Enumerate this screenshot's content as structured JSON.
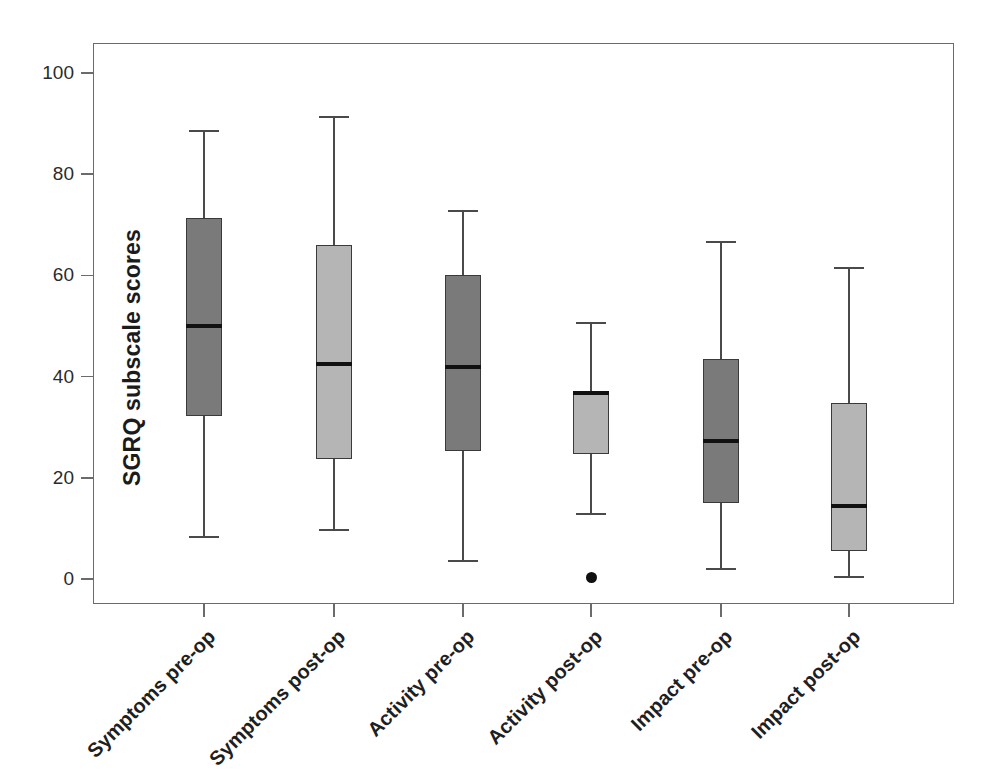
{
  "figure": {
    "width": 990,
    "height": 771,
    "background": "#ffffff",
    "frame_color": "#6b6b6b"
  },
  "chart_data": {
    "type": "box",
    "title": "",
    "xlabel": "",
    "ylabel": "SGRQ subscale scores",
    "ylim": [
      0,
      100
    ],
    "yticks": [
      0,
      20,
      40,
      60,
      80,
      100
    ],
    "ytick_labels": [
      "0",
      "20",
      "40",
      "60",
      "80",
      "100"
    ],
    "grid": false,
    "legend": "none",
    "categories": [
      "Symptoms pre-op",
      "Symptoms post-op",
      "Activity pre-op",
      "Activity post-op",
      "Impact pre-op",
      "Impact post-op"
    ],
    "colors": {
      "pre_op_fill": "#7a7a7a",
      "post_op_fill": "#b5b5b5",
      "median_line": "#111111",
      "box_edge": "#3a3a3a",
      "whisker": "#4a4a4a",
      "outlier": "#101010"
    },
    "boxes": [
      {
        "category": "Symptoms pre-op",
        "fill": "dark",
        "whisker_high": 88.7,
        "q3": 71.3,
        "median": 50.0,
        "q1": 32.2,
        "whisker_low": 8.5,
        "outliers": []
      },
      {
        "category": "Symptoms post-op",
        "fill": "light",
        "whisker_high": 91.5,
        "q3": 66.0,
        "median": 42.5,
        "q1": 23.7,
        "whisker_low": 9.9,
        "outliers": []
      },
      {
        "category": "Activity pre-op",
        "fill": "dark",
        "whisker_high": 72.9,
        "q3": 60.1,
        "median": 41.9,
        "q1": 25.3,
        "whisker_low": 3.8,
        "outliers": []
      },
      {
        "category": "Activity post-op",
        "fill": "light",
        "whisker_high": 50.8,
        "q3": 37.2,
        "median": 36.8,
        "q1": 24.7,
        "whisker_low": 13.0,
        "outliers": [
          0.2
        ]
      },
      {
        "category": "Impact pre-op",
        "fill": "dark",
        "whisker_high": 66.8,
        "q3": 43.5,
        "median": 27.3,
        "q1": 15.0,
        "whisker_low": 2.2,
        "outliers": []
      },
      {
        "category": "Impact post-op",
        "fill": "light",
        "whisker_high": 61.7,
        "q3": 34.8,
        "median": 14.4,
        "q1": 5.5,
        "whisker_low": 0.6,
        "outliers": []
      }
    ]
  },
  "geometry": {
    "plot": {
      "left": 93,
      "top": 43,
      "width": 861,
      "height": 561
    },
    "y_pixel_at_0": 535,
    "y_pixel_at_100": 29,
    "box_centers_px": [
      110,
      240,
      369,
      497,
      627,
      755
    ],
    "box_width_px": 36
  }
}
